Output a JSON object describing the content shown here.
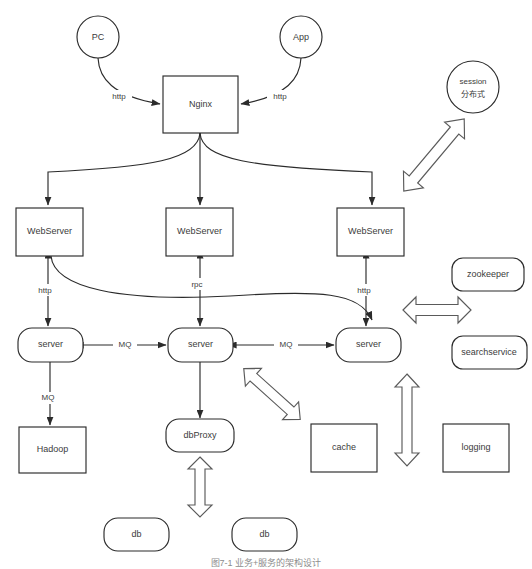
{
  "diagram": {
    "background_color": "#ffffff",
    "stroke_color": "#2b2b2b",
    "block_arrow_color": "#5a5a5a",
    "caption": "图7-1 业务+服务的架构设计",
    "nodes": {
      "pc": {
        "label": "PC",
        "shape": "circle"
      },
      "app": {
        "label": "App",
        "shape": "circle"
      },
      "session": {
        "label_line1": "session",
        "label_line2": "分布式",
        "shape": "circle"
      },
      "nginx": {
        "label": "Nginx",
        "shape": "rect"
      },
      "webserver_left": {
        "label": "WebServer",
        "shape": "rect"
      },
      "webserver_mid": {
        "label": "WebServer",
        "shape": "rect"
      },
      "webserver_right": {
        "label": "WebServer",
        "shape": "rect"
      },
      "server_left": {
        "label": "server",
        "shape": "rounded"
      },
      "server_mid": {
        "label": "server",
        "shape": "rounded"
      },
      "server_right": {
        "label": "server",
        "shape": "rounded"
      },
      "zookeeper": {
        "label": "zookeeper",
        "shape": "rounded"
      },
      "searchservice": {
        "label": "searchservice",
        "shape": "rounded"
      },
      "hadoop": {
        "label": "Hadoop",
        "shape": "rect"
      },
      "dbproxy": {
        "label": "dbProxy",
        "shape": "rounded"
      },
      "cache": {
        "label": "cache",
        "shape": "rect"
      },
      "logging": {
        "label": "logging",
        "shape": "rect"
      },
      "db_left": {
        "label": "db",
        "shape": "rounded"
      },
      "db_right": {
        "label": "db",
        "shape": "rounded"
      }
    },
    "edge_labels": {
      "pc_nginx": "http",
      "app_nginx": "http",
      "webleft_serverleft": "http",
      "webmid_servermid": "rpc",
      "webright_serverright": "http",
      "serverleft_servermid": "MQ",
      "servermid_serverright": "MQ",
      "serverleft_hadoop": "MQ"
    }
  }
}
